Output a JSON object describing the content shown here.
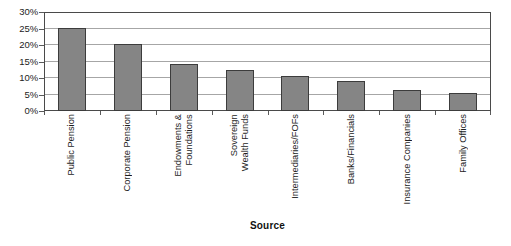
{
  "chart_data": {
    "type": "bar",
    "title": "",
    "xlabel": "Source",
    "ylabel": "",
    "categories": [
      "Public Pension",
      "Corporate Pension",
      "Endowments & Foundations",
      "Sovereign Wealth Funds",
      "Intermediaries/FOFs",
      "Banks/Financials",
      "Insurance Companies",
      "Family Offices"
    ],
    "category_lines": [
      [
        "Public Pension"
      ],
      [
        "Corporate Pension"
      ],
      [
        "Endowments &",
        "Foundations"
      ],
      [
        "Sovereign",
        "Wealth Funds"
      ],
      [
        "Intermediaries/FOFs"
      ],
      [
        "Banks/Financials"
      ],
      [
        "Insurance Companies"
      ],
      [
        "Family Offices"
      ]
    ],
    "values": [
      25.3,
      20.3,
      14.3,
      12.5,
      10.5,
      9.0,
      6.5,
      5.5
    ],
    "ylim": [
      0,
      30
    ],
    "yticks": [
      0,
      5,
      10,
      15,
      20,
      25,
      30
    ],
    "ytick_labels": [
      "0%",
      "5%",
      "10%",
      "15%",
      "20%",
      "25%",
      "30%"
    ],
    "grid": true,
    "legend": "none",
    "bar_color": "#858585",
    "bar_border_color": "#3c3c3c",
    "gridline_color": "#a6a6a6",
    "frame_color": "#4a4a4a"
  },
  "axis": {
    "x_title": "Source"
  }
}
